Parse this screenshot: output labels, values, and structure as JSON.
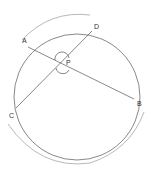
{
  "diagram": {
    "type": "circle-intersecting-chords",
    "circle": {
      "cx": 77,
      "cy": 97,
      "r": 63
    },
    "points": {
      "A": {
        "label": "A",
        "x": 28,
        "y": 47,
        "lx": 22,
        "ly": 43
      },
      "D": {
        "label": "D",
        "x": 92,
        "y": 31,
        "lx": 94,
        "ly": 29
      },
      "C": {
        "label": "C",
        "x": 16,
        "y": 108,
        "lx": 9,
        "ly": 118
      },
      "B": {
        "label": "B",
        "x": 134,
        "y": 99,
        "lx": 137,
        "ly": 106
      },
      "P": {
        "label": "P",
        "x": 62,
        "y": 62,
        "lx": 66,
        "ly": 63
      }
    },
    "chords": [
      {
        "from": "A",
        "to": "B"
      },
      {
        "from": "C",
        "to": "D"
      }
    ],
    "outer_arcs": [
      {
        "name": "arc-top",
        "path": "M 22 40 Q 50 10 90 15"
      },
      {
        "name": "arc-bottom",
        "path": "M 8 124 Q 40 170 90 163 Q 130 150 144 112"
      }
    ],
    "angle_marks": [
      {
        "name": "angle-APC-marks",
        "at": "P",
        "r": 7
      }
    ],
    "colors": {
      "line": "#555555",
      "label": "#333333",
      "arc": "#888888"
    }
  }
}
